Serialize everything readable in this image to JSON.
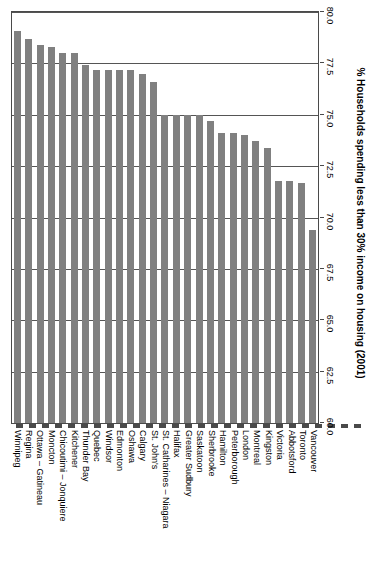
{
  "chart_data": {
    "type": "bar",
    "title": "",
    "subtitle": "",
    "orientation": "vertical-bars-rotated-90",
    "xlabel": "",
    "ylabel": "% Households spending less than 30% income on housing (2001)",
    "ylim": [
      60.0,
      80.0
    ],
    "y_tick_labels": [
      "60.0",
      "62.5",
      "65.0",
      "67.5",
      "70.0",
      "72.5",
      "75.0",
      "77.5",
      "80.0"
    ],
    "y_ticks": [
      60.0,
      62.5,
      65.0,
      67.5,
      70.0,
      72.5,
      75.0,
      77.5,
      80.0
    ],
    "grid": true,
    "legend": null,
    "bar_color": "#808080",
    "axis_color": "#4a4a4a",
    "categories": [
      "Winnipeg",
      "Regina",
      "Ottawa – Gatineau",
      "Moncton",
      "Chicoutimi – Jonquiere",
      "Kitchener",
      "Thunder Bay",
      "Quebec",
      "Windsor",
      "Edmonton",
      "Oshawa",
      "Calgary",
      "St. John's",
      "St. Catharines – Niagara",
      "Halifax",
      "Greater Sudbury",
      "Saskatoon",
      "Sherbrooke",
      "Hamilton",
      "Peterborough",
      "London",
      "Montreal",
      "Kingston",
      "Victoria",
      "Abbotsford",
      "Toronto",
      "Vancouver"
    ],
    "values": [
      79.1,
      78.7,
      78.4,
      78.3,
      78.0,
      78.0,
      77.4,
      77.2,
      77.2,
      77.2,
      77.2,
      77.0,
      76.6,
      75.0,
      75.0,
      75.0,
      75.0,
      74.7,
      74.1,
      74.1,
      74.0,
      73.7,
      73.4,
      71.8,
      71.8,
      71.7,
      69.4
    ]
  }
}
